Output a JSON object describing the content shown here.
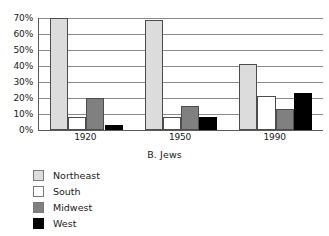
{
  "chart_data": {
    "type": "bar",
    "title": "",
    "subtitle": "B. Jews",
    "xlabel": "",
    "ylabel": "",
    "categories": [
      "1920",
      "1950",
      "1990"
    ],
    "series": [
      {
        "name": "Northeast",
        "values": [
          70,
          69,
          41
        ],
        "color": "#dcdcdc"
      },
      {
        "name": "South",
        "values": [
          8,
          8,
          21
        ],
        "color": "#ffffff"
      },
      {
        "name": "Midwest",
        "values": [
          20,
          15,
          13
        ],
        "color": "#808080"
      },
      {
        "name": "West",
        "values": [
          3,
          8,
          23
        ],
        "color": "#000000"
      }
    ],
    "ylim": [
      0,
      70
    ],
    "ytick_values": [
      0,
      10,
      20,
      30,
      40,
      50,
      60,
      70
    ],
    "ytick_labels": [
      "0%",
      "10%",
      "20%",
      "30%",
      "40%",
      "50%",
      "60%",
      "70%"
    ],
    "grid": true,
    "legend_position": "below-left"
  },
  "legend": {
    "items": [
      {
        "label": "Northeast",
        "color": "#dcdcdc"
      },
      {
        "label": "South",
        "color": "#ffffff"
      },
      {
        "label": "Midwest",
        "color": "#808080"
      },
      {
        "label": "West",
        "color": "#000000"
      }
    ]
  }
}
